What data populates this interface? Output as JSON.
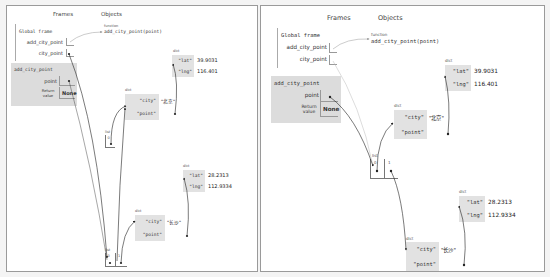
{
  "panels": [
    {
      "id": "left",
      "headers": {
        "frames": "Frames",
        "objects": "Objects"
      },
      "global_frame": {
        "title": "Global frame",
        "vars": [
          {
            "name": "add_city_point",
            "value": ""
          },
          {
            "name": "city_point",
            "value": ""
          }
        ]
      },
      "call_frame": {
        "title": "add_city_point",
        "vars": [
          {
            "name": "point",
            "value": ""
          },
          {
            "name": "Return value",
            "value": "None"
          }
        ]
      },
      "function_object": {
        "type": "function",
        "signature": "add_city_point(point)"
      },
      "objects": {
        "dict_beijing_coords": {
          "type": "dict",
          "entries": [
            {
              "key": "\"lat\"",
              "value": "39.9031"
            },
            {
              "key": "\"lng\"",
              "value": "116.401"
            }
          ]
        },
        "dict_beijing": {
          "type": "dict",
          "entries": [
            {
              "key": "\"city\"",
              "value": "\"北京\""
            },
            {
              "key": "\"point\"",
              "value": ""
            }
          ]
        },
        "list_one": {
          "type": "list",
          "indices": [
            "0"
          ]
        },
        "dict_changsha_coords": {
          "type": "dict",
          "entries": [
            {
              "key": "\"lat\"",
              "value": "28.2313"
            },
            {
              "key": "\"lng\"",
              "value": "112.9334"
            }
          ]
        },
        "dict_changsha": {
          "type": "dict",
          "entries": [
            {
              "key": "\"city\"",
              "value": "\"长沙\""
            },
            {
              "key": "\"point\"",
              "value": ""
            }
          ]
        },
        "list_two": {
          "type": "list",
          "indices": [
            "0",
            "1"
          ]
        }
      }
    },
    {
      "id": "right",
      "headers": {
        "frames": "Frames",
        "objects": "Objects"
      },
      "global_frame": {
        "title": "Global frame",
        "vars": [
          {
            "name": "add_city_point",
            "value": ""
          },
          {
            "name": "city_point",
            "value": ""
          }
        ]
      },
      "call_frame": {
        "title": "add_city_point",
        "vars": [
          {
            "name": "point",
            "value": ""
          },
          {
            "name": "Return value",
            "value": "None"
          }
        ]
      },
      "function_object": {
        "type": "function",
        "signature": "add_city_point(point)"
      },
      "objects": {
        "dict_beijing_coords": {
          "type": "dict",
          "entries": [
            {
              "key": "\"lat\"",
              "value": "39.9031"
            },
            {
              "key": "\"lng\"",
              "value": "116.401"
            }
          ]
        },
        "dict_beijing": {
          "type": "dict",
          "entries": [
            {
              "key": "\"city\"",
              "value": "\"北京\""
            },
            {
              "key": "\"point\"",
              "value": ""
            }
          ]
        },
        "list_main": {
          "type": "list",
          "indices": [
            "0",
            "1"
          ]
        },
        "dict_changsha_coords": {
          "type": "dict",
          "entries": [
            {
              "key": "\"lat\"",
              "value": "28.2313"
            },
            {
              "key": "\"lng\"",
              "value": "112.9334"
            }
          ]
        },
        "dict_changsha": {
          "type": "dict",
          "entries": [
            {
              "key": "\"city\"",
              "value": "\"长沙\""
            },
            {
              "key": "\"point\"",
              "value": ""
            }
          ]
        }
      }
    }
  ]
}
